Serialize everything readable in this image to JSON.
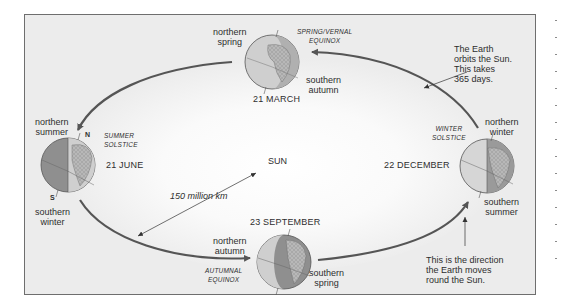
{
  "diagram": {
    "center_label": "SUN",
    "distance_label": "150 million km",
    "orbit_note": "The Earth\norbits the Sun.\nThis takes\n365 days.",
    "direction_note": "This is the direction\nthe Earth moves\nround the Sun.",
    "colors": {
      "background": "#ececec",
      "frame": "#6e6e6e",
      "orbit_line": "#555555",
      "globe_light": "#d8d8d8",
      "globe_dark": "#8c8c8c",
      "text": "#2e2e2e"
    },
    "positions": [
      {
        "id": "march",
        "date": "21 MARCH",
        "event": "SPRING/VERNAL\nEQUINOX",
        "north": "northern\nspring",
        "south": "southern\nautumn"
      },
      {
        "id": "june",
        "date": "21 JUNE",
        "event": "SUMMER\nSOLSTICE",
        "north": "northern\nsummer",
        "south": "southern\nwinter",
        "pole_n": "N",
        "pole_s": "S"
      },
      {
        "id": "september",
        "date": "23 SEPTEMBER",
        "event": "AUTUMNAL\nEQUINOX",
        "north": "northern\nautumn",
        "south": "southern\nspring"
      },
      {
        "id": "december",
        "date": "22 DECEMBER",
        "event": "WINTER\nSOLSTICE",
        "north": "northern\nwinter",
        "south": "southern\nsummer"
      }
    ]
  }
}
